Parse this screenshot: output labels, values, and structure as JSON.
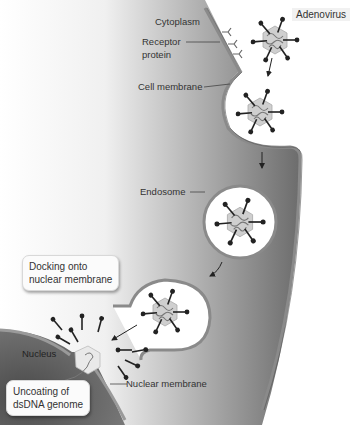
{
  "figure": {
    "type": "biological-process-diagram"
  },
  "labels": {
    "adenovirus": "Adenovirus",
    "cytoplasm": "Cytoplasm",
    "receptor_line1": "Receptor",
    "receptor_line2": "protein",
    "cell_membrane": "Cell membrane",
    "endosome": "Endosome",
    "nucleus": "Nucleus",
    "nuclear_membrane": "Nuclear membrane"
  },
  "steps": [
    {
      "line1": "Docking onto",
      "line2": "nuclear membrane"
    },
    {
      "line1": "Uncoating of",
      "line2": "dsDNA genome"
    }
  ],
  "colors": {
    "cytoplasm_dark": "#6e6e6e",
    "cytoplasm_light": "#ffffff",
    "membrane": "#8a8a8a",
    "capsid": "#c9c9c9",
    "fiber": "#222222",
    "nucleus": "#5a5a5a"
  }
}
